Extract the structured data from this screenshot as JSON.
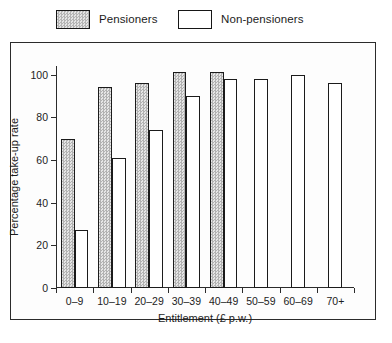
{
  "legend": {
    "entries": [
      {
        "label": "Pensioners",
        "swatch": "hatched-grey-swatch"
      },
      {
        "label": "Non-pensioners",
        "swatch": "white-swatch"
      }
    ]
  },
  "chart_data": {
    "type": "bar",
    "title": "",
    "xlabel": "Entitlement (£ p.w.)",
    "ylabel": "Percentage take-up rate",
    "categories": [
      "0–9",
      "10–19",
      "20–29",
      "30–39",
      "40–49",
      "50–59",
      "60–69",
      "70+"
    ],
    "series": [
      {
        "name": "Pensioners",
        "values": [
          70,
          94,
          96,
          101,
          101,
          null,
          null,
          null
        ]
      },
      {
        "name": "Non-pensioners",
        "values": [
          27,
          61,
          74,
          90,
          98,
          98,
          100,
          96
        ]
      }
    ],
    "ylim": [
      0,
      100
    ],
    "yticks": [
      0,
      20,
      40,
      60,
      80,
      100
    ],
    "ytick_labels": [
      "0",
      "20",
      "40",
      "60",
      "80",
      "100"
    ],
    "grid": false,
    "legend_position": "above-plot"
  },
  "colors": {
    "pensioner_fill": "#c9c9c9",
    "nonpensioner_fill": "#ffffff",
    "outline": "#1b1b1b",
    "axis": "#2b2b2b",
    "background": "#ffffff"
  }
}
